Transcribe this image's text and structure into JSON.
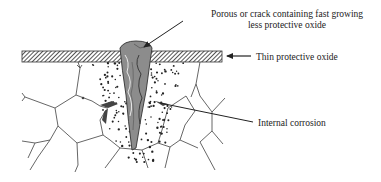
{
  "diagram": {
    "type": "schematic",
    "labels": {
      "porous_line1": "Porous or crack containing fast growing",
      "porous_line2": "less protective oxide",
      "thin_oxide": "Thin protective oxide",
      "internal_corrosion": "Internal corrosion"
    },
    "elements": [
      {
        "id": "thin-oxide-layer",
        "desc": "hatched horizontal oxide band"
      },
      {
        "id": "oxide-nodule",
        "desc": "gray cracked wedge-shaped oxide penetrating the metal"
      },
      {
        "id": "internal-corrosion-zone",
        "desc": "dotted region of internal oxide precipitates"
      },
      {
        "id": "grain-boundaries",
        "desc": "polygonal grain boundary network of the metal"
      }
    ],
    "colors": {
      "line": "#333333",
      "nodule_fill": "#8a8a8a",
      "nodule_dark": "#555555",
      "hatch": "#333333",
      "dots": "#222222"
    }
  }
}
